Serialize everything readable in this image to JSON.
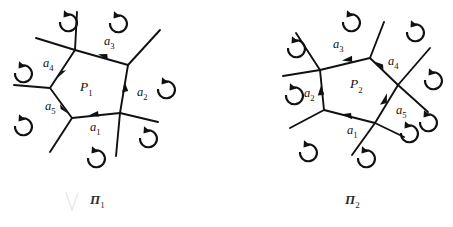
{
  "figure": {
    "background_color": "#ffffff",
    "ink_color": "#111111",
    "title_note": "Two oriented polygon cell diagrams with rotation arrows",
    "panels": [
      {
        "id": "panel-left",
        "caption": "Π",
        "caption_sub": "1",
        "face_label": "P",
        "face_label_sub": "1",
        "edge_labels": [
          {
            "name": "a",
            "sub": "1",
            "x": 90,
            "y": 128
          },
          {
            "name": "a",
            "sub": "2",
            "x": 137,
            "y": 93
          },
          {
            "name": "a",
            "sub": "3",
            "x": 104,
            "y": 42
          },
          {
            "name": "a",
            "sub": "4",
            "x": 47,
            "y": 64
          },
          {
            "name": "a",
            "sub": "5",
            "x": 49,
            "y": 107
          }
        ],
        "rotation_arrow_count": 7
      },
      {
        "id": "panel-right",
        "caption": "Π",
        "caption_sub": "2",
        "face_label": "P",
        "face_label_sub": "2",
        "edge_labels": [
          {
            "name": "a",
            "sub": "1",
            "x": 347,
            "y": 131
          },
          {
            "name": "a",
            "sub": "2",
            "x": 308,
            "y": 94
          },
          {
            "name": "a",
            "sub": "3",
            "x": 337,
            "y": 45
          },
          {
            "name": "a",
            "sub": "4",
            "x": 391,
            "y": 62
          },
          {
            "name": "a",
            "sub": "5",
            "x": 398,
            "y": 111
          }
        ],
        "rotation_arrow_count": 9
      }
    ]
  }
}
